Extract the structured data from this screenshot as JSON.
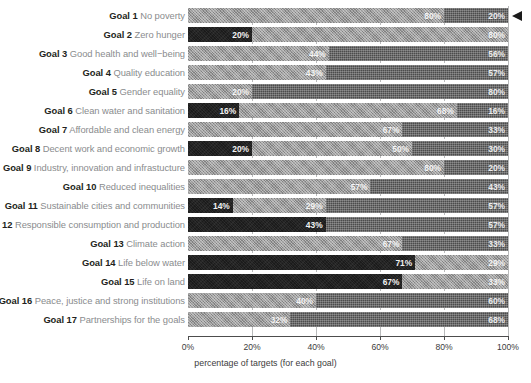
{
  "chart_data": {
    "type": "bar",
    "orientation": "horizontal",
    "stacked": true,
    "stacked_normalized": true,
    "title": "",
    "xlabel": "percentage of targets (for each goal)",
    "ylabel": "",
    "xlim": [
      0,
      100
    ],
    "xticks": [
      0,
      20,
      40,
      60,
      80,
      100
    ],
    "xticklabels": [
      "0%",
      "20%",
      "40%",
      "60%",
      "80%",
      "100%"
    ],
    "grid": true,
    "legend": "none",
    "unit": "%",
    "categories": [
      "Goal 1 No poverty",
      "Goal 2 Zero hunger",
      "Goal 3 Good health and well−being",
      "Goal 4 Quality education",
      "Goal 5 Gender equality",
      "Goal 6 Clean water and sanitation",
      "Goal 7 Affordable and clean energy",
      "Goal 8 Decent work and economic growth",
      "Goal 9 Industry, innovation and infrastucture",
      "Goal 10 Reduced inequalities",
      "Goal 11 Sustainable cities and communities",
      "Goal 12 Responsible consumption and production",
      "Goal 13 Climate action",
      "Goal 14 Life below water",
      "Goal 15 Life on land",
      "Goal 16 Peace, justice and strong institutions",
      "Goal 17 Partnerships for the goals"
    ],
    "series": [
      {
        "name": "dark",
        "style": "s-dark",
        "color": "#1b1b1b",
        "values": [
          0,
          20,
          0,
          0,
          0,
          16,
          0,
          20,
          0,
          0,
          14,
          43,
          0,
          71,
          67,
          0,
          0
        ]
      },
      {
        "name": "light",
        "style": "s-light",
        "color": "#9a9a9a",
        "values": [
          80,
          80,
          44,
          43,
          20,
          68,
          67,
          50,
          80,
          57,
          29,
          0,
          67,
          29,
          33,
          40,
          32
        ]
      },
      {
        "name": "medium",
        "style": "s-med",
        "color": "#4c4c4c",
        "values": [
          20,
          0,
          56,
          57,
          80,
          16,
          33,
          30,
          20,
          43,
          57,
          57,
          33,
          0,
          0,
          60,
          68
        ]
      }
    ]
  },
  "rows": [
    {
      "goal": "Goal 1",
      "name": "No poverty",
      "segments": [
        {
          "style": "s-light",
          "value": 80,
          "label": "80%"
        },
        {
          "style": "s-med",
          "value": 20,
          "label": "20%"
        }
      ]
    },
    {
      "goal": "Goal 2",
      "name": "Zero hunger",
      "segments": [
        {
          "style": "s-dark",
          "value": 20,
          "label": "20%"
        },
        {
          "style": "s-light",
          "value": 80,
          "label": "80%"
        }
      ]
    },
    {
      "goal": "Goal 3",
      "name": "Good health and well−being",
      "segments": [
        {
          "style": "s-light",
          "value": 44,
          "label": "44%"
        },
        {
          "style": "s-med",
          "value": 56,
          "label": "56%"
        }
      ]
    },
    {
      "goal": "Goal 4",
      "name": "Quality education",
      "segments": [
        {
          "style": "s-light",
          "value": 43,
          "label": "43%"
        },
        {
          "style": "s-med",
          "value": 57,
          "label": "57%"
        }
      ]
    },
    {
      "goal": "Goal 5",
      "name": "Gender equality",
      "segments": [
        {
          "style": "s-light",
          "value": 20,
          "label": "20%"
        },
        {
          "style": "s-med",
          "value": 80,
          "label": "80%"
        }
      ]
    },
    {
      "goal": "Goal 6",
      "name": "Clean water and sanitation",
      "segments": [
        {
          "style": "s-dark",
          "value": 16,
          "label": "16%"
        },
        {
          "style": "s-light",
          "value": 68,
          "label": "68%"
        },
        {
          "style": "s-med",
          "value": 16,
          "label": "16%"
        }
      ]
    },
    {
      "goal": "Goal 7",
      "name": "Affordable and clean energy",
      "segments": [
        {
          "style": "s-light",
          "value": 67,
          "label": "67%"
        },
        {
          "style": "s-med",
          "value": 33,
          "label": "33%"
        }
      ]
    },
    {
      "goal": "Goal 8",
      "name": "Decent work and economic growth",
      "segments": [
        {
          "style": "s-dark",
          "value": 20,
          "label": "20%"
        },
        {
          "style": "s-light",
          "value": 50,
          "label": "50%"
        },
        {
          "style": "s-med",
          "value": 30,
          "label": "30%"
        }
      ]
    },
    {
      "goal": "Goal 9",
      "name": "Industry, innovation and infrastucture",
      "segments": [
        {
          "style": "s-light",
          "value": 80,
          "label": "80%"
        },
        {
          "style": "s-med",
          "value": 20,
          "label": "20%"
        }
      ]
    },
    {
      "goal": "Goal 10",
      "name": "Reduced inequalities",
      "segments": [
        {
          "style": "s-light",
          "value": 57,
          "label": "57%"
        },
        {
          "style": "s-med",
          "value": 43,
          "label": "43%"
        }
      ]
    },
    {
      "goal": "Goal 11",
      "name": "Sustainable cities and communities",
      "segments": [
        {
          "style": "s-dark",
          "value": 14,
          "label": "14%"
        },
        {
          "style": "s-light",
          "value": 29,
          "label": "29%"
        },
        {
          "style": "s-med",
          "value": 57,
          "label": "57%"
        }
      ]
    },
    {
      "goal": "Goal 12",
      "name": "Responsible consumption and production",
      "segments": [
        {
          "style": "s-dark",
          "value": 43,
          "label": "43%"
        },
        {
          "style": "s-med",
          "value": 57,
          "label": "57%"
        }
      ]
    },
    {
      "goal": "Goal 13",
      "name": "Climate action",
      "segments": [
        {
          "style": "s-light",
          "value": 67,
          "label": "67%"
        },
        {
          "style": "s-med",
          "value": 33,
          "label": "33%"
        }
      ]
    },
    {
      "goal": "Goal 14",
      "name": "Life below water",
      "segments": [
        {
          "style": "s-dark",
          "value": 71,
          "label": "71%"
        },
        {
          "style": "s-light",
          "value": 29,
          "label": "29%"
        }
      ]
    },
    {
      "goal": "Goal 15",
      "name": "Life on land",
      "segments": [
        {
          "style": "s-dark",
          "value": 67,
          "label": "67%"
        },
        {
          "style": "s-light",
          "value": 33,
          "label": "33%"
        }
      ]
    },
    {
      "goal": "Goal 16",
      "name": "Peace, justice and strong institutions",
      "segments": [
        {
          "style": "s-light",
          "value": 40,
          "label": "40%"
        },
        {
          "style": "s-med",
          "value": 60,
          "label": "60%"
        }
      ]
    },
    {
      "goal": "Goal 17",
      "name": "Partnerships for the goals",
      "segments": [
        {
          "style": "s-light",
          "value": 32,
          "label": "32%"
        },
        {
          "style": "s-med",
          "value": 68,
          "label": "68%"
        }
      ]
    }
  ],
  "axis": {
    "xlabel": "percentage of targets (for each goal)",
    "ticklabels": [
      "0%",
      "20%",
      "40%",
      "60%",
      "80%",
      "100%"
    ]
  }
}
